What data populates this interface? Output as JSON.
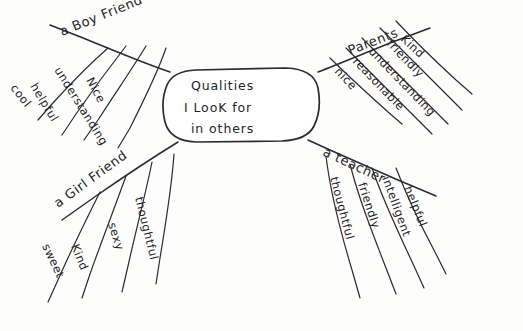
{
  "diagram": {
    "kind": "hand-drawn-mind-map",
    "medium": "pen-on-paper",
    "ink_color": "#232329",
    "paper_color": "#fdfdfc",
    "center": {
      "line1": "Qualities",
      "line2": "I LooK for",
      "line3": "in others"
    },
    "branches": [
      {
        "id": "boy-friend",
        "label": "a Boy Friend",
        "position": "top-left",
        "twigs": [
          "cool",
          "helpful",
          "understanding",
          "Nice"
        ]
      },
      {
        "id": "parents",
        "label": "Parents",
        "position": "top-right",
        "twigs": [
          "Kind",
          "friendly",
          "understanding",
          "reasonable",
          "nice"
        ]
      },
      {
        "id": "girl-friend",
        "label": "a Girl Friend",
        "position": "bottom-left",
        "twigs": [
          "sweet",
          "Kind",
          "sexy",
          "thoughtful"
        ]
      },
      {
        "id": "teacher",
        "label": "a teacher",
        "position": "bottom-right",
        "twigs": [
          "helpful",
          "intelligent",
          "friendly",
          "thoughtful"
        ]
      }
    ]
  }
}
